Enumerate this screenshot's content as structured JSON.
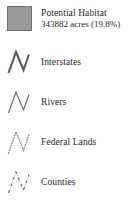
{
  "legend": {
    "entries": [
      {
        "label": "Potential Habitat",
        "sublabel": "343882 acres (19.8%)",
        "symbol": "filled-square-swatch",
        "fill_color": "#9a9a9a",
        "border_color": "#6e6e6e",
        "acres": "343882",
        "percent": "19.8%"
      },
      {
        "label": "Interstates",
        "symbol": "thick-solid-zigzag-line",
        "line_color": "#5a5a5a"
      },
      {
        "label": "Rivers",
        "symbol": "thin-solid-zigzag-line",
        "line_color": "#6a6a6a"
      },
      {
        "label": "Federal Lands",
        "symbol": "dotted-zigzag-line",
        "line_color": "#8d8d8d"
      },
      {
        "label": "Counties",
        "symbol": "dash-dot-zigzag-line",
        "line_color": "#707070"
      }
    ]
  }
}
